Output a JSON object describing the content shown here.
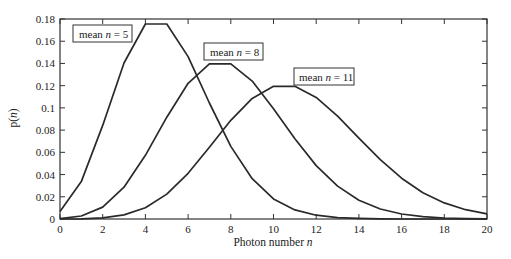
{
  "chart_data": {
    "type": "line",
    "title": "",
    "xlabel": "Photon number n",
    "ylabel": "p(n)",
    "xlim": [
      0,
      20
    ],
    "ylim": [
      0,
      0.18
    ],
    "grid": false,
    "x": [
      0,
      1,
      2,
      3,
      4,
      5,
      6,
      7,
      8,
      9,
      10,
      11,
      12,
      13,
      14,
      15,
      16,
      17,
      18,
      19,
      20
    ],
    "x_ticks": [
      "0",
      "2",
      "4",
      "6",
      "8",
      "10",
      "12",
      "14",
      "16",
      "18",
      "20"
    ],
    "y_ticks": [
      "0",
      "0.02",
      "0.04",
      "0.06",
      "0.08",
      "0.1",
      "0.12",
      "0.14",
      "0.16",
      "0.18"
    ],
    "series": [
      {
        "name": "mean n = 5",
        "values": [
          0.0067,
          0.0337,
          0.0842,
          0.1404,
          0.1755,
          0.1755,
          0.1462,
          0.1044,
          0.0653,
          0.0363,
          0.0181,
          0.0082,
          0.0034,
          0.0013,
          0.0005,
          0.0002,
          0.0,
          0.0,
          0.0,
          0.0,
          0.0
        ]
      },
      {
        "name": "mean n = 8",
        "values": [
          0.0003,
          0.0027,
          0.0107,
          0.0286,
          0.0573,
          0.0916,
          0.1221,
          0.1396,
          0.1396,
          0.1241,
          0.0993,
          0.0722,
          0.0481,
          0.0296,
          0.0169,
          0.009,
          0.0045,
          0.0021,
          0.0009,
          0.0004,
          0.0002
        ]
      },
      {
        "name": "mean n = 11",
        "values": [
          0.0,
          0.0002,
          0.001,
          0.0037,
          0.0102,
          0.0224,
          0.0411,
          0.0646,
          0.0888,
          0.1085,
          0.1194,
          0.1194,
          0.1094,
          0.0926,
          0.0728,
          0.0534,
          0.0367,
          0.0237,
          0.0145,
          0.0084,
          0.0046
        ]
      }
    ],
    "annotations": [
      {
        "text": "mean n = 5",
        "x_px": 77,
        "y_px": 27
      },
      {
        "text": "mean n = 8",
        "x_px": 208,
        "y_px": 44
      },
      {
        "text": "mean n = 11",
        "x_px": 298,
        "y_px": 69
      }
    ]
  },
  "labels": {
    "xlabel_prefix": "Photon number ",
    "xlabel_var": "n",
    "ylabel_prefix": "p(",
    "ylabel_var": "n",
    "ylabel_suffix": ")",
    "legend_prefix": "mean ",
    "legend_var": "n",
    "legend_5": " = 5",
    "legend_8": " = 8",
    "legend_11": " = 11"
  }
}
